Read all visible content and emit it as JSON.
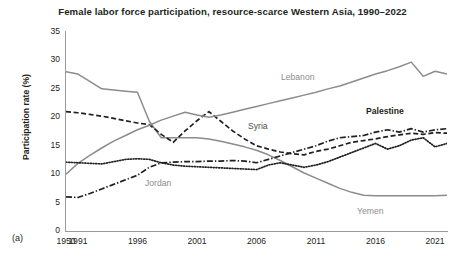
{
  "figure": {
    "title": "Female labor force participation, resource-scarce Western Asia, 1990–2022",
    "panel_label": "(a)",
    "y_axis_title": "Participation rate (%)"
  },
  "axes": {
    "y_ticks": [
      "0",
      "5",
      "10",
      "15",
      "20",
      "25",
      "30",
      "35"
    ],
    "x_ticks": [
      "1950",
      "1991",
      "1996",
      "2001",
      "2006",
      "2011",
      "2016",
      "2021"
    ]
  },
  "series_labels": {
    "lebanon": "Lebanon",
    "syria": "Syria",
    "palestine": "Palestine",
    "jordan": "Jordan",
    "yemen": "Yemen"
  },
  "colors": {
    "gray_line": "#8c8c8c",
    "dark_line": "#231f20",
    "axis": "#9a9a9a",
    "text": "#231f20",
    "label_gray": "#8c8c8c"
  },
  "chart_data": {
    "type": "line",
    "title": "Female labor force participation, resource-scarce Western Asia, 1990–2022",
    "xlabel": "",
    "ylabel": "Participation rate (%)",
    "ylim": [
      0,
      35
    ],
    "xlim": [
      1990,
      2022
    ],
    "grid": false,
    "legend": "inline-annotations",
    "x": [
      1990,
      1991,
      1992,
      1993,
      1994,
      1995,
      1996,
      1997,
      1998,
      1999,
      2000,
      2001,
      2002,
      2003,
      2004,
      2005,
      2006,
      2007,
      2008,
      2009,
      2010,
      2011,
      2012,
      2013,
      2014,
      2015,
      2016,
      2017,
      2018,
      2019,
      2020,
      2021,
      2022
    ],
    "series": [
      {
        "name": "Yemen",
        "style": "solid",
        "color": "#8c8c8c",
        "values": [
          28.0,
          27.6,
          26.3,
          25.0,
          24.8,
          24.6,
          24.4,
          19.3,
          16.4,
          16.4,
          16.4,
          16.4,
          16.2,
          15.8,
          15.3,
          14.8,
          14.2,
          13.4,
          12.4,
          11.3,
          10.2,
          9.3,
          8.4,
          7.5,
          6.8,
          6.3,
          6.2,
          6.2,
          6.2,
          6.2,
          6.2,
          6.2,
          6.3
        ]
      },
      {
        "name": "Syria",
        "style": "dashed",
        "color": "#231f20",
        "values": [
          21.0,
          20.8,
          20.5,
          20.2,
          19.8,
          19.4,
          19.0,
          18.7,
          17.0,
          15.6,
          17.6,
          19.4,
          21.0,
          19.3,
          17.6,
          16.2,
          15.0,
          14.4,
          13.9,
          13.6,
          13.4,
          14.0,
          14.4,
          15.0,
          15.6,
          15.9,
          16.2,
          16.6,
          16.9,
          17.2,
          17.0,
          17.3,
          17.2
        ]
      },
      {
        "name": "Lebanon",
        "style": "solid",
        "color": "#8c8c8c",
        "values": [
          10.0,
          11.9,
          13.3,
          14.6,
          15.8,
          16.8,
          17.8,
          18.6,
          19.5,
          20.2,
          20.9,
          20.4,
          20.0,
          20.4,
          20.9,
          21.4,
          21.9,
          22.4,
          22.9,
          23.4,
          23.9,
          24.4,
          25.0,
          25.5,
          26.2,
          26.9,
          27.6,
          28.2,
          28.9,
          29.7,
          27.2,
          28.1,
          27.6
        ]
      },
      {
        "name": "Jordan",
        "style": "dotted",
        "color": "#231f20",
        "values": [
          12.1,
          12.0,
          11.9,
          11.8,
          12.2,
          12.6,
          12.7,
          12.6,
          12.0,
          11.6,
          11.4,
          11.3,
          11.2,
          11.1,
          11.0,
          10.9,
          10.8,
          11.6,
          12.0,
          11.6,
          11.2,
          11.6,
          12.2,
          13.0,
          13.8,
          14.6,
          15.4,
          14.4,
          15.0,
          16.0,
          16.4,
          14.8,
          15.4
        ]
      },
      {
        "name": "Palestine",
        "style": "dash-dot",
        "color": "#231f20",
        "values": [
          6.0,
          5.9,
          6.6,
          7.4,
          8.2,
          9.0,
          9.8,
          11.2,
          12.0,
          12.1,
          12.2,
          12.2,
          12.3,
          12.3,
          12.4,
          12.3,
          12.0,
          12.6,
          13.2,
          13.8,
          14.4,
          15.0,
          15.8,
          16.4,
          16.6,
          16.8,
          17.4,
          17.8,
          17.4,
          18.0,
          17.4,
          17.8,
          18.0
        ]
      }
    ]
  }
}
